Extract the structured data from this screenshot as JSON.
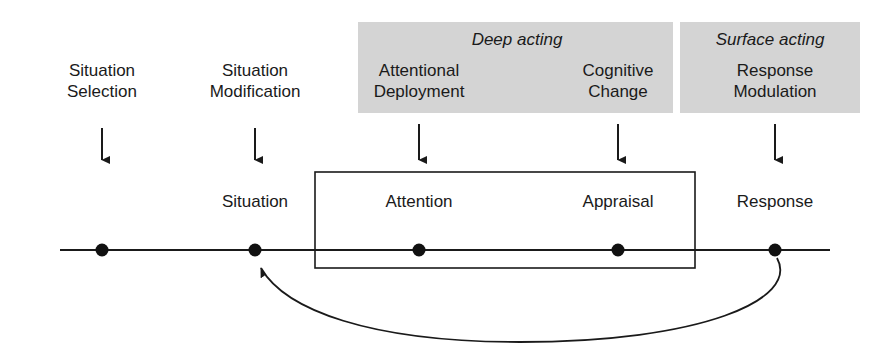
{
  "diagram": {
    "colors": {
      "band_fill": "#d4d4d4",
      "line": "#1a1a1a",
      "node": "#111111",
      "text": "#1a1a1a"
    },
    "bands": [
      {
        "id": "deep-acting",
        "label": "Deep acting",
        "x": 358,
        "y": 22,
        "width": 315,
        "height": 91
      },
      {
        "id": "surface-acting",
        "label": "Surface acting",
        "x": 680,
        "y": 22,
        "width": 180,
        "height": 91
      }
    ],
    "strategies": [
      {
        "id": "situation-selection",
        "line1": "Situation",
        "line2": "Selection",
        "center_x": 102,
        "y": 60,
        "shaded": false,
        "arrow": {
          "x": 102,
          "y_start": 128,
          "y_end": 167
        }
      },
      {
        "id": "situation-modification",
        "line1": "Situation",
        "line2": "Modification",
        "center_x": 255,
        "y": 60,
        "shaded": false,
        "arrow": {
          "x": 255,
          "y_start": 128,
          "y_end": 167
        }
      },
      {
        "id": "attentional-deployment",
        "line1": "Attentional",
        "line2": "Deployment",
        "center_x": 419,
        "y": 60,
        "shaded": true,
        "arrow": {
          "x": 419,
          "y_start": 124,
          "y_end": 167
        }
      },
      {
        "id": "cognitive-change",
        "line1": "Cognitive",
        "line2": "Change",
        "center_x": 618,
        "y": 60,
        "shaded": true,
        "arrow": {
          "x": 618,
          "y_start": 124,
          "y_end": 167
        }
      },
      {
        "id": "response-modulation",
        "line1": "Response",
        "line2": "Modulation",
        "center_x": 775,
        "y": 60,
        "shaded": true,
        "arrow": {
          "x": 775,
          "y_start": 124,
          "y_end": 167
        }
      }
    ],
    "timeline": {
      "y": 250,
      "x_start": 60,
      "x_end": 830,
      "nodes": [
        {
          "id": "situation",
          "label": "Situation",
          "x": 255,
          "label_y": 192
        },
        {
          "id": "attention",
          "label": "Attention",
          "x": 419,
          "label_y": 192
        },
        {
          "id": "appraisal",
          "label": "Appraisal",
          "x": 618,
          "label_y": 192
        },
        {
          "id": "response",
          "label": "Response",
          "x": 775,
          "label_y": 192
        },
        {
          "id": "antecedent",
          "label": "",
          "x": 102,
          "label_y": 192
        }
      ]
    },
    "inner_box": {
      "id": "cognitive-processing-box",
      "x": 315,
      "y": 172,
      "width": 380,
      "height": 96
    },
    "feedback_arc": {
      "id": "response-to-situation-feedback",
      "from_x": 775,
      "from_y": 258,
      "to_x": 256,
      "to_y": 262,
      "dip_y": 340
    }
  }
}
